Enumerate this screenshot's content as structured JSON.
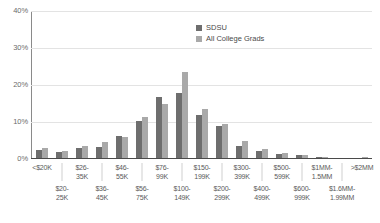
{
  "chart_data": {
    "type": "bar",
    "title": "",
    "subtitle": "",
    "xlabel": "",
    "ylabel": "",
    "ylim": [
      0,
      40
    ],
    "yunit": "%",
    "grid": true,
    "legend_position": "top-right",
    "ytick_labels": [
      "40%",
      "30%",
      "20%",
      "10%",
      "0%"
    ],
    "ytick_values": [
      40,
      30,
      20,
      10,
      0
    ],
    "categories": [
      "<$20K",
      "$20-25K",
      "$26-35K",
      "$36-45K",
      "$46-55K",
      "$56-75K",
      "$76-99K",
      "$100-149K",
      "$150-199K",
      "$200-299K",
      "$300-399K",
      "$400-499K",
      "$500-599K",
      "$600-999K",
      "$1MM-1.5MM",
      "$1.6MM-1.99MM",
      ">$2MM"
    ],
    "category_rows": [
      "top",
      "bottom",
      "top",
      "bottom",
      "top",
      "bottom",
      "top",
      "bottom",
      "top",
      "bottom",
      "top",
      "bottom",
      "top",
      "bottom",
      "top",
      "bottom",
      "top"
    ],
    "series": [
      {
        "name": "SDSU",
        "color": "#6e6e6e",
        "values": [
          2.4,
          1.9,
          3.0,
          3.2,
          6.3,
          10.3,
          16.8,
          17.8,
          12.0,
          9.0,
          3.6,
          2.1,
          1.3,
          1.1,
          0.5,
          0.3,
          0.4
        ]
      },
      {
        "name": "All College Grads",
        "color": "#a9a9a9",
        "values": [
          3.0,
          2.1,
          3.4,
          4.6,
          6.0,
          11.3,
          14.9,
          23.5,
          13.6,
          9.4,
          4.8,
          2.6,
          1.5,
          1.2,
          0.6,
          0.4,
          0.5
        ]
      }
    ]
  },
  "legend": {
    "items": [
      {
        "label": "SDSU",
        "swatch": "s0"
      },
      {
        "label": "All College Grads",
        "swatch": "s1"
      }
    ]
  }
}
